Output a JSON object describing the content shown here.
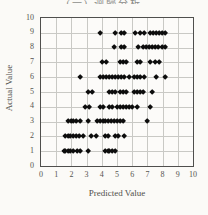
{
  "page": {
    "clipped_heading": "(一) 迴歸分析"
  },
  "chart_data": {
    "type": "scatter",
    "title": "",
    "xlabel": "Predicted Value",
    "ylabel": "Actual Value",
    "xlim": [
      0,
      10
    ],
    "ylim": [
      0,
      10
    ],
    "xticks": [
      0,
      1,
      2,
      3,
      4,
      5,
      6,
      7,
      8,
      9,
      10
    ],
    "yticks": [
      0,
      1,
      2,
      3,
      4,
      5,
      6,
      7,
      8,
      9,
      10
    ],
    "grid": true,
    "legend": false,
    "marker": "diamond",
    "marker_color": "#0d0d0d",
    "points": [
      [
        1.5,
        1
      ],
      [
        1.6,
        1
      ],
      [
        1.8,
        1
      ],
      [
        1.9,
        1
      ],
      [
        2.1,
        1
      ],
      [
        2.4,
        1
      ],
      [
        2.6,
        1
      ],
      [
        3.1,
        1
      ],
      [
        4.2,
        1
      ],
      [
        4.4,
        1
      ],
      [
        4.5,
        1
      ],
      [
        4.7,
        1
      ],
      [
        4.9,
        1
      ],
      [
        1.6,
        2
      ],
      [
        1.8,
        2
      ],
      [
        1.9,
        2
      ],
      [
        2.1,
        2
      ],
      [
        2.3,
        2
      ],
      [
        2.5,
        2
      ],
      [
        2.8,
        2
      ],
      [
        3.3,
        2
      ],
      [
        3.6,
        2
      ],
      [
        4.2,
        2
      ],
      [
        4.4,
        2
      ],
      [
        4.9,
        2
      ],
      [
        5.1,
        2
      ],
      [
        5.5,
        2
      ],
      [
        1.8,
        3
      ],
      [
        2.0,
        3
      ],
      [
        2.1,
        3
      ],
      [
        2.3,
        3
      ],
      [
        2.6,
        3
      ],
      [
        3.1,
        3
      ],
      [
        3.7,
        3
      ],
      [
        3.9,
        3
      ],
      [
        4.1,
        3
      ],
      [
        4.2,
        3
      ],
      [
        4.4,
        3
      ],
      [
        4.6,
        3
      ],
      [
        4.8,
        3
      ],
      [
        5.0,
        3
      ],
      [
        5.2,
        3
      ],
      [
        5.4,
        3
      ],
      [
        7.0,
        3
      ],
      [
        2.9,
        4
      ],
      [
        3.2,
        4
      ],
      [
        3.9,
        4
      ],
      [
        4.1,
        4
      ],
      [
        4.5,
        4
      ],
      [
        4.7,
        4
      ],
      [
        5.0,
        4
      ],
      [
        5.2,
        4
      ],
      [
        5.4,
        4
      ],
      [
        5.6,
        4
      ],
      [
        5.8,
        4
      ],
      [
        6.0,
        4
      ],
      [
        6.3,
        4
      ],
      [
        7.2,
        4
      ],
      [
        3.1,
        5
      ],
      [
        3.4,
        5
      ],
      [
        4.5,
        5
      ],
      [
        4.7,
        5
      ],
      [
        4.9,
        5
      ],
      [
        5.2,
        5
      ],
      [
        5.4,
        5
      ],
      [
        5.6,
        5
      ],
      [
        6.1,
        5
      ],
      [
        6.3,
        5
      ],
      [
        6.5,
        5
      ],
      [
        6.7,
        5
      ],
      [
        7.3,
        5
      ],
      [
        2.6,
        6
      ],
      [
        3.9,
        6
      ],
      [
        4.1,
        6
      ],
      [
        4.3,
        6
      ],
      [
        4.5,
        6
      ],
      [
        4.7,
        6
      ],
      [
        4.9,
        6
      ],
      [
        5.1,
        6
      ],
      [
        5.3,
        6
      ],
      [
        5.5,
        6
      ],
      [
        5.8,
        6
      ],
      [
        6.1,
        6
      ],
      [
        6.3,
        6
      ],
      [
        6.5,
        6
      ],
      [
        6.8,
        6
      ],
      [
        7.6,
        6
      ],
      [
        8.2,
        6
      ],
      [
        4.0,
        7
      ],
      [
        4.3,
        7
      ],
      [
        5.2,
        7
      ],
      [
        5.4,
        7
      ],
      [
        5.6,
        7
      ],
      [
        6.3,
        7
      ],
      [
        6.5,
        7
      ],
      [
        7.2,
        7
      ],
      [
        7.5,
        7
      ],
      [
        7.8,
        7
      ],
      [
        4.8,
        8
      ],
      [
        5.3,
        8
      ],
      [
        5.5,
        8
      ],
      [
        6.4,
        8
      ],
      [
        6.7,
        8
      ],
      [
        6.9,
        8
      ],
      [
        7.1,
        8
      ],
      [
        7.3,
        8
      ],
      [
        7.5,
        8
      ],
      [
        7.7,
        8
      ],
      [
        8.0,
        8
      ],
      [
        8.2,
        8
      ],
      [
        3.9,
        9
      ],
      [
        4.9,
        9
      ],
      [
        5.3,
        9
      ],
      [
        5.5,
        9
      ],
      [
        6.2,
        9
      ],
      [
        6.5,
        9
      ],
      [
        6.8,
        9
      ],
      [
        7.2,
        9
      ],
      [
        7.4,
        9
      ],
      [
        7.6,
        9
      ],
      [
        7.8,
        9
      ],
      [
        8.0,
        9
      ],
      [
        8.2,
        9
      ]
    ]
  }
}
